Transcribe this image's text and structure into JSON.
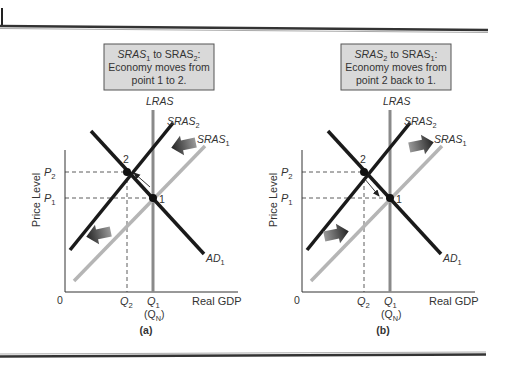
{
  "figure": {
    "panels": [
      {
        "id": "a",
        "caption": "(a)",
        "box": {
          "line1_pre": "SRAS",
          "line1_sub1": "1",
          "line1_mid": " to SRAS",
          "line1_sub2": "2",
          "line1_post": ":",
          "line2": "Economy moves from",
          "line3": "point 1 to 2."
        },
        "shift_direction": "left",
        "move_arrow": "1-to-2"
      },
      {
        "id": "b",
        "caption": "(b)",
        "box": {
          "line1_pre": "SRAS",
          "line1_sub1": "2",
          "line1_mid": " to SRAS",
          "line1_sub2": "1",
          "line1_post": ":",
          "line2": "Economy moves from",
          "line3": "point 2 back to 1."
        },
        "shift_direction": "right",
        "move_arrow": "2-to-1"
      }
    ],
    "labels": {
      "ylabel": "Price Level",
      "xlabel": "Real GDP",
      "origin": "0",
      "lras": "LRAS",
      "sras": "SRAS",
      "ad": "AD",
      "sub1": "1",
      "sub2": "2",
      "p": "P",
      "q": "Q",
      "qn_open": "(Q",
      "qn_sub": "N",
      "qn_close": ")",
      "point1": "1",
      "point2": "2"
    },
    "colors": {
      "box_fill": "#d9d9d9",
      "box_border": "#555555",
      "dark_curve": "#1a1a1a",
      "light_curve": "#b5b5b5",
      "lras": "#8a8a8a"
    }
  }
}
